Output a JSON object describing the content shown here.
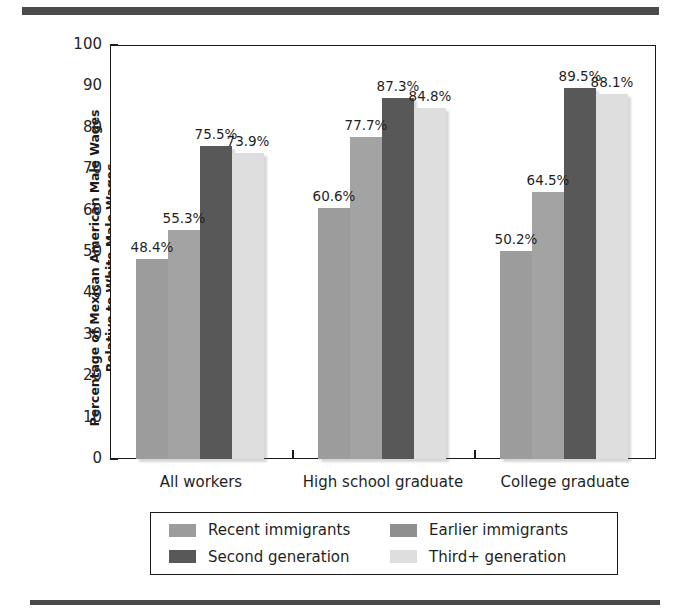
{
  "figure": {
    "top_rule_name": "top-decorative-rule",
    "bottom_rule_name": "bottom-decorative-rule"
  },
  "chart_data": {
    "type": "bar",
    "title": "",
    "subtitle": "",
    "xlabel": "",
    "ylabel_line1": "Percentage of Mexican American Male Wages",
    "ylabel_line2": "Relative to White Male Wages",
    "categories": [
      "All workers",
      "High school graduate",
      "College graduate"
    ],
    "ylim": [
      0,
      100
    ],
    "yticks": [
      0,
      10,
      20,
      30,
      40,
      50,
      60,
      70,
      80,
      90,
      100
    ],
    "ytick_labels": [
      "0",
      "10",
      "20",
      "30",
      "40",
      "50",
      "60",
      "70",
      "80",
      "90",
      "100"
    ],
    "grid": false,
    "legend_position": "below-plot",
    "series": [
      {
        "name": "Recent immigrants",
        "color": "#9c9c9c",
        "values": [
          48.4,
          60.6,
          50.2
        ],
        "labels": [
          "48.4%",
          "60.6%",
          "50.2%"
        ]
      },
      {
        "name": "Earlier immigrants",
        "color": "#a3a3a3",
        "values": [
          55.3,
          77.7,
          64.5
        ],
        "labels": [
          "55.3%",
          "77.7%",
          "64.5%"
        ]
      },
      {
        "name": "Second generation",
        "color": "#585858",
        "values": [
          75.5,
          87.3,
          89.5
        ],
        "labels": [
          "75.5%",
          "87.3%",
          "89.5%"
        ]
      },
      {
        "name": "Third+ generation",
        "color": "#dedede",
        "values": [
          73.9,
          84.8,
          88.1
        ],
        "labels": [
          "73.9%",
          "84.8%",
          "88.1%"
        ]
      }
    ]
  },
  "legend": {
    "items": [
      {
        "label": "Recent immigrants",
        "color": "#9c9c9c"
      },
      {
        "label": "Earlier immigrants",
        "color": "#8f8f8f"
      },
      {
        "label": "Second generation",
        "color": "#585858"
      },
      {
        "label": "Third+ generation",
        "color": "#dedede"
      }
    ]
  }
}
